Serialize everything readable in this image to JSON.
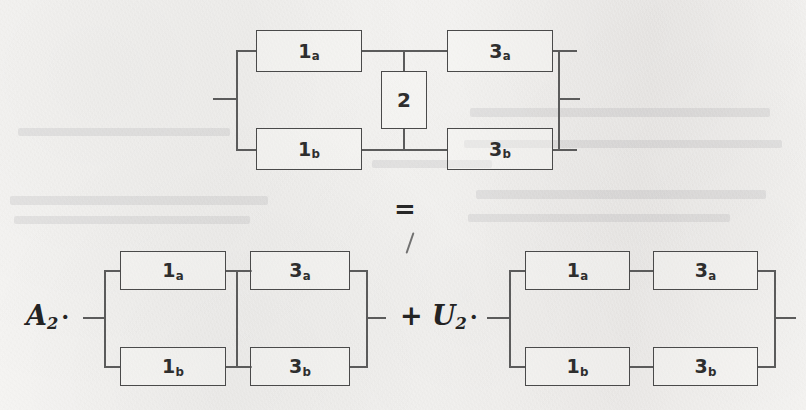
{
  "page": {
    "kind": "scanned-textbook-figure",
    "equation_symbol": "=",
    "background_color": "#f3f2f0",
    "line_color": "#5b5b5b",
    "text_color": "#2e2e2e"
  },
  "labels": {
    "block_1a": "1",
    "block_1a_sub": "a",
    "block_1b": "1",
    "block_1b_sub": "b",
    "block_3a": "3",
    "block_3a_sub": "a",
    "block_3b": "3",
    "block_3b_sub": "b",
    "block_2": "2"
  },
  "coefficients": {
    "left": {
      "operator": "",
      "symbol": "A",
      "subscript": "2",
      "dot": "·"
    },
    "right": {
      "operator": "+",
      "symbol": "U",
      "subscript": "2",
      "dot": "·"
    }
  },
  "diagrams": [
    {
      "id": "bridge-network",
      "name": "bridge-network-diagram",
      "position": "top-center",
      "description": "Bridge network: blocks 1a and 1b in parallel on the left, blocks 3a and 3b in parallel on the right, joined by bridging block 2 across the two middle nodes.",
      "blocks": [
        "1a",
        "1b",
        "3a",
        "3b",
        "2"
      ],
      "has_bridge_element": true
    },
    {
      "id": "series-parallel-network",
      "name": "series-parallel-network-diagram",
      "position": "bottom-left",
      "description": "Bridge element shorted: middle nodes tied together. Blocks 1a and 1b in parallel, then 3a and 3b in parallel, connected in series.",
      "blocks": [
        "1a",
        "1b",
        "3a",
        "3b"
      ],
      "has_bridge_element": false,
      "middle_nodes_shorted": true,
      "coefficient": "A2"
    },
    {
      "id": "parallel-series-network",
      "name": "parallel-series-network-diagram",
      "position": "bottom-right",
      "description": "Bridge element open: two independent series branches, 1a-3a in the upper path and 1b-3b in the lower path, connected in parallel.",
      "blocks": [
        "1a",
        "1b",
        "3a",
        "3b"
      ],
      "has_bridge_element": false,
      "middle_nodes_shorted": false,
      "coefficient": "U2"
    }
  ]
}
